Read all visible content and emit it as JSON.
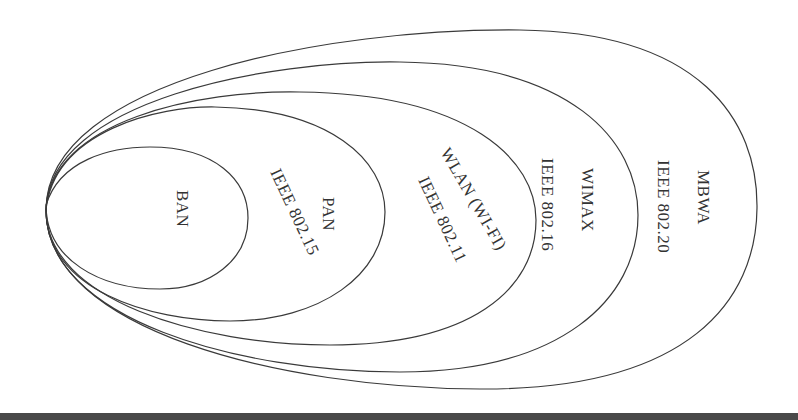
{
  "diagram": {
    "type": "nested-ellipses",
    "stroke_color": "#3a3a3a",
    "background": "#ffffff",
    "band_color": "#4a4a4a",
    "networks": [
      {
        "name": "BAN",
        "standard": ""
      },
      {
        "name": "PAN",
        "standard": "IEEE 802.15"
      },
      {
        "name": "WLAN (WI-FI)",
        "standard": "IEEE 802.11"
      },
      {
        "name": "WIMAX",
        "standard": "IEEE 802.16"
      },
      {
        "name": "MBWA",
        "standard": "IEEE 802.20"
      }
    ]
  }
}
